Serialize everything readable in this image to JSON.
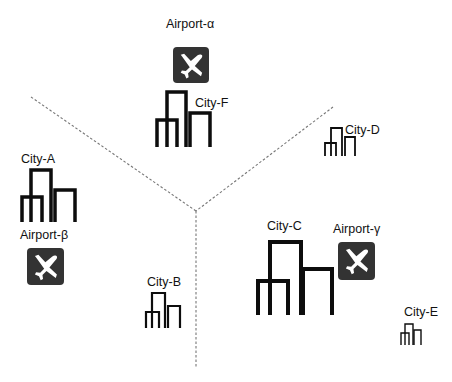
{
  "colors": {
    "background": "#ffffff",
    "building_stroke": "#0d0d0d",
    "airport_fill": "#333333",
    "airport_plane": "#ffffff",
    "divider": "#777777",
    "text": "#111111"
  },
  "dividers": [
    {
      "name": "divider-left",
      "x1": 31,
      "y1": 97,
      "x2": 196,
      "y2": 211
    },
    {
      "name": "divider-right",
      "x1": 333,
      "y1": 107,
      "x2": 196,
      "y2": 211
    },
    {
      "name": "divider-bottom",
      "x1": 196,
      "y1": 211,
      "x2": 196,
      "y2": 367
    }
  ],
  "airports": [
    {
      "id": "alpha",
      "label": "Airport-α",
      "box": {
        "x": 173,
        "y": 47,
        "w": 36,
        "h": 36
      },
      "label_pos": {
        "x": 166,
        "y": 18
      }
    },
    {
      "id": "beta",
      "label": "Airport-β",
      "box": {
        "x": 27,
        "y": 248,
        "w": 37,
        "h": 37
      },
      "label_pos": {
        "x": 20,
        "y": 229
      }
    },
    {
      "id": "gamma",
      "label": "Airport-γ",
      "box": {
        "x": 338,
        "y": 242,
        "w": 37,
        "h": 38
      },
      "label_pos": {
        "x": 333,
        "y": 223
      }
    }
  ],
  "cities": [
    {
      "id": "A",
      "label": "City-A",
      "label_pos": {
        "x": 21,
        "y": 153
      },
      "stroke": 3.5,
      "towers": [
        [
          22,
          197,
          42,
          222
        ],
        [
          31,
          170,
          51,
          222
        ],
        [
          55,
          190,
          75,
          222
        ]
      ]
    },
    {
      "id": "B",
      "label": "City-B",
      "label_pos": {
        "x": 147,
        "y": 276
      },
      "stroke": 2.2,
      "towers": [
        [
          146,
          312,
          159,
          328
        ],
        [
          152,
          293,
          165,
          328
        ],
        [
          168,
          306,
          180,
          328
        ]
      ]
    },
    {
      "id": "C",
      "label": "City-C",
      "label_pos": {
        "x": 267,
        "y": 220
      },
      "stroke": 4,
      "towers": [
        [
          258,
          281,
          288,
          315
        ],
        [
          270,
          242,
          301,
          315
        ],
        [
          303,
          269,
          332,
          315
        ]
      ]
    },
    {
      "id": "D",
      "label": "City-D",
      "label_pos": {
        "x": 345,
        "y": 124
      },
      "stroke": 1.8,
      "towers": [
        [
          325,
          143,
          336,
          156
        ],
        [
          331,
          128,
          342,
          156
        ],
        [
          345,
          137,
          355,
          156
        ]
      ]
    },
    {
      "id": "E",
      "label": "City-E",
      "label_pos": {
        "x": 404,
        "y": 306
      },
      "stroke": 1.4,
      "towers": [
        [
          401,
          333,
          409,
          345
        ],
        [
          405,
          324,
          413,
          345
        ],
        [
          414,
          330,
          421,
          345
        ]
      ]
    },
    {
      "id": "F",
      "label": "City-F",
      "label_pos": {
        "x": 195,
        "y": 97
      },
      "stroke": 3.5,
      "towers": [
        [
          157,
          120,
          177,
          147
        ],
        [
          167,
          92,
          186,
          147
        ],
        [
          190,
          113,
          210,
          147
        ]
      ]
    }
  ]
}
